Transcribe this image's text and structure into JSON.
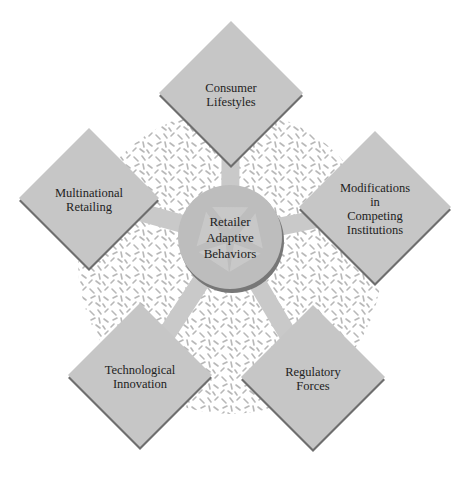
{
  "center": {
    "label": "Retailer\nAdaptive\nBehaviors",
    "x": 230,
    "y": 237,
    "r": 52
  },
  "factors": [
    {
      "id": "consumer-lifestyles",
      "label": "Consumer\nLifestyles",
      "x": 231,
      "y": 93,
      "half": 72
    },
    {
      "id": "multinational-retailing",
      "label": "Multinational\nRetailing",
      "x": 89,
      "y": 198,
      "half": 70
    },
    {
      "id": "modifications-competing-institutions",
      "label": "Modifications\nin\nCompeting\nInstitutions",
      "x": 375,
      "y": 207,
      "half": 76
    },
    {
      "id": "technological-innovation",
      "label": "Technological\nInnovation",
      "x": 140,
      "y": 375,
      "half": 72
    },
    {
      "id": "regulatory-forces",
      "label": "Regulatory\nForces",
      "x": 313,
      "y": 377,
      "half": 72
    }
  ],
  "colors": {
    "diamond_fill": "#c6c6c6",
    "diamond_shadow": "#6e6e6e",
    "circle_fill": "#bdbdbd",
    "circle_shadow": "#777777",
    "arrow_fill": "#c9c9c9",
    "pattern_bg": "#ffffff",
    "pattern_dash": "#b8b8b8",
    "text": "#222222"
  }
}
